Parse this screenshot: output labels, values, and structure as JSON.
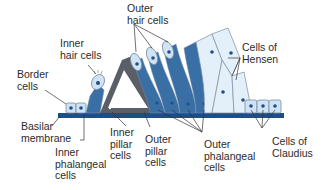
{
  "diagram": {
    "colors": {
      "dark_blue": "#3a6fa5",
      "mid_blue": "#5b8cc0",
      "light_blue": "#cfe3f3",
      "pale_blue": "#e4f0f9",
      "pillar_gray": "#5a5e66",
      "membrane": "#1d4f86",
      "nucleus": "#1f4e8c",
      "outline": "#7a8ea3",
      "leader": "#333333"
    },
    "labels": {
      "outer_hair_cells": "Outer\nhair cells",
      "inner_hair_cells": "Inner\nhair cells",
      "border_cells": "Border\ncells",
      "cells_of_hensen": "Cells of\nHensen",
      "basilar_membrane": "Basilar\nmembrane",
      "inner_phalangeal_cells": "Inner\nphalangeal\ncells",
      "inner_pillar_cells": "Inner\npillar\ncells",
      "outer_pillar_cells": "Outer\npillar\ncells",
      "outer_phalangeal_cells": "Outer\nphalangeal\ncells",
      "cells_of_claudius": "Cells of\nClaudius"
    }
  }
}
